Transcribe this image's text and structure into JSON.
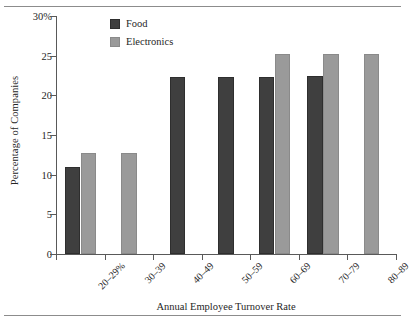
{
  "chart_data": {
    "type": "bar",
    "title": "",
    "xlabel": "Annual Employee Turnover Rate",
    "ylabel": "Percentage of Companies",
    "categories": [
      "20–29%",
      "30–39",
      "40–49",
      "50–59",
      "60–69",
      "70–79",
      "80–89"
    ],
    "series": [
      {
        "name": "Food",
        "color": "#3f3f3f",
        "values": [
          11.0,
          null,
          22.3,
          22.3,
          22.3,
          22.4,
          null
        ]
      },
      {
        "name": "Electronics",
        "color": "#9a9a9a",
        "values": [
          12.7,
          12.7,
          null,
          null,
          25.2,
          25.2,
          25.2
        ]
      }
    ],
    "ylim": [
      0,
      30
    ],
    "yticks": [
      0,
      5,
      10,
      15,
      20,
      25,
      30
    ],
    "ytick_labels": [
      "0",
      "5",
      "10",
      "15",
      "20",
      "25",
      "30%"
    ],
    "grid": false,
    "legend_position": "top-left-inside"
  },
  "legend": {
    "items": [
      {
        "label": "Food"
      },
      {
        "label": "Electronics"
      }
    ]
  },
  "axes": {
    "y_title": "Percentage of Companies",
    "x_title": "Annual Employee Turnover Rate"
  }
}
